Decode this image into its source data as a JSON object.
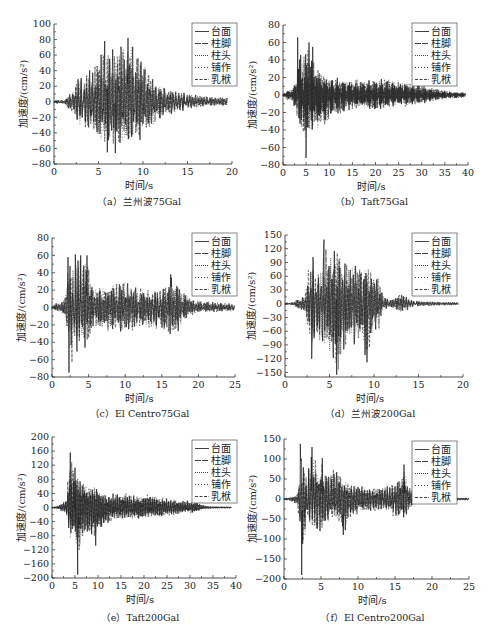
{
  "figure": {
    "panel_count": 6,
    "shared_legend": [
      "台面",
      "柱脚",
      "柱头",
      "铺作",
      "乳栿"
    ]
  },
  "chart_data": [
    {
      "id": "a",
      "type": "line",
      "title": "（a）兰州波75Gal",
      "xlabel": "时间/s",
      "ylabel": "加速度/(cm/s²)",
      "xlim": [
        0,
        20
      ],
      "ylim": [
        -80,
        100
      ],
      "xticks": [
        0,
        5,
        10,
        15,
        20
      ],
      "xtick_labels": [
        "0",
        "5",
        "10",
        "15",
        "20"
      ],
      "yticks": [
        -80,
        -60,
        -40,
        -20,
        0,
        20,
        40,
        60,
        80,
        100
      ],
      "ytick_labels": [
        "−80",
        "−60",
        "−40",
        "−20",
        "0",
        "20",
        "40",
        "60",
        "80",
        "100"
      ],
      "grid": false,
      "legend_position": "upper right",
      "duration": 19.5,
      "series": [
        {
          "name": "台面",
          "line": "solid"
        },
        {
          "name": "柱脚",
          "line": "long-dash"
        },
        {
          "name": "柱头",
          "line": "dense-dot"
        },
        {
          "name": "铺作",
          "line": "sparse-dot"
        },
        {
          "name": "乳栿",
          "line": "dash"
        }
      ],
      "envelope": [
        [
          0,
          2,
          2
        ],
        [
          1.2,
          3,
          3
        ],
        [
          1.5,
          8,
          10
        ],
        [
          2,
          12,
          15
        ],
        [
          2.7,
          35,
          30
        ],
        [
          3.5,
          40,
          40
        ],
        [
          4.5,
          50,
          45
        ],
        [
          5.5,
          70,
          60
        ],
        [
          6.5,
          75,
          62
        ],
        [
          7.5,
          78,
          60
        ],
        [
          8.5,
          80,
          60
        ],
        [
          9.5,
          70,
          55
        ],
        [
          10.5,
          45,
          40
        ],
        [
          11.5,
          25,
          28
        ],
        [
          12.5,
          20,
          20
        ],
        [
          13.5,
          16,
          16
        ],
        [
          15,
          12,
          10
        ],
        [
          17,
          8,
          6
        ],
        [
          19.5,
          6,
          5
        ]
      ],
      "peaks": [
        [
          8.3,
          82
        ],
        [
          6.0,
          -65
        ],
        [
          6.9,
          -66
        ],
        [
          5.7,
          78
        ]
      ]
    },
    {
      "id": "b",
      "type": "line",
      "title": "（b）Taft75Gal",
      "xlabel": "时间/s",
      "ylabel": "加速度/(cm/s²)",
      "xlim": [
        0,
        40
      ],
      "ylim": [
        -80,
        80
      ],
      "xticks": [
        0,
        5,
        10,
        15,
        20,
        25,
        30,
        35,
        40
      ],
      "xtick_labels": [
        "0",
        "5",
        "10",
        "15",
        "20",
        "25",
        "30",
        "35",
        "40"
      ],
      "yticks": [
        -80,
        -60,
        -40,
        -20,
        0,
        20,
        40,
        60,
        80
      ],
      "ytick_labels": [
        "−80",
        "−60",
        "−40",
        "−20",
        "0",
        "20",
        "40",
        "60",
        "80"
      ],
      "grid": false,
      "legend_position": "upper right",
      "duration": 39.5,
      "series": [
        {
          "name": "台面",
          "line": "solid"
        },
        {
          "name": "柱脚",
          "line": "long-dash"
        },
        {
          "name": "柱头",
          "line": "dense-dot"
        },
        {
          "name": "铺作",
          "line": "sparse-dot"
        },
        {
          "name": "乳栿",
          "line": "dash"
        }
      ],
      "envelope": [
        [
          0,
          2,
          2
        ],
        [
          1,
          6,
          6
        ],
        [
          2,
          8,
          6
        ],
        [
          3,
          20,
          25
        ],
        [
          3.2,
          66,
          30
        ],
        [
          4,
          45,
          45
        ],
        [
          5,
          50,
          60
        ],
        [
          6,
          55,
          50
        ],
        [
          7,
          40,
          45
        ],
        [
          9,
          25,
          38
        ],
        [
          11,
          20,
          25
        ],
        [
          15,
          18,
          18
        ],
        [
          20,
          20,
          18
        ],
        [
          25,
          18,
          15
        ],
        [
          30,
          12,
          10
        ],
        [
          33,
          8,
          8
        ],
        [
          36,
          4,
          4
        ],
        [
          39.5,
          3,
          3
        ]
      ],
      "peaks": [
        [
          3.2,
          66
        ],
        [
          5.0,
          -72
        ],
        [
          5.6,
          60
        ],
        [
          6.4,
          55
        ]
      ]
    },
    {
      "id": "c",
      "type": "line",
      "title": "（c）El Centro75Gal",
      "xlabel": "时间/s",
      "ylabel": "加速度/(cm/s²)",
      "xlim": [
        0,
        25
      ],
      "ylim": [
        -80,
        80
      ],
      "xticks": [
        0,
        5,
        10,
        15,
        20,
        25
      ],
      "xtick_labels": [
        "0",
        "5",
        "10",
        "15",
        "20",
        "25"
      ],
      "yticks": [
        -80,
        -60,
        -40,
        -20,
        0,
        20,
        40,
        60,
        80
      ],
      "ytick_labels": [
        "−80",
        "−60",
        "−40",
        "−20",
        "0",
        "20",
        "40",
        "60",
        "80"
      ],
      "grid": false,
      "legend_position": "upper right",
      "duration": 25,
      "series": [
        {
          "name": "台面",
          "line": "solid"
        },
        {
          "name": "柱脚",
          "line": "long-dash"
        },
        {
          "name": "柱头",
          "line": "dense-dot"
        },
        {
          "name": "铺作",
          "line": "sparse-dot"
        },
        {
          "name": "乳栿",
          "line": "dash"
        }
      ],
      "envelope": [
        [
          0,
          2,
          2
        ],
        [
          1,
          8,
          6
        ],
        [
          1.7,
          10,
          10
        ],
        [
          2.2,
          60,
          40
        ],
        [
          2.6,
          50,
          70
        ],
        [
          3.2,
          60,
          60
        ],
        [
          3.9,
          60,
          40
        ],
        [
          4.8,
          60,
          50
        ],
        [
          5.5,
          25,
          25
        ],
        [
          7,
          25,
          30
        ],
        [
          8.2,
          30,
          30
        ],
        [
          9.5,
          33,
          30
        ],
        [
          11,
          25,
          28
        ],
        [
          13,
          22,
          25
        ],
        [
          15.5,
          25,
          30
        ],
        [
          16.2,
          38,
          35
        ],
        [
          17.2,
          28,
          30
        ],
        [
          18.5,
          15,
          12
        ],
        [
          20,
          8,
          6
        ],
        [
          23,
          6,
          5
        ],
        [
          25,
          4,
          4
        ]
      ],
      "peaks": [
        [
          2.3,
          -75
        ],
        [
          2.2,
          58
        ],
        [
          3.2,
          61
        ],
        [
          3.9,
          60
        ],
        [
          4.8,
          60
        ],
        [
          16.2,
          38
        ]
      ]
    },
    {
      "id": "d",
      "type": "line",
      "title": "（d）兰州波200Gal",
      "xlabel": "时间/s",
      "ylabel": "加速度/(cm/s²)",
      "xlim": [
        0,
        20
      ],
      "ylim": [
        -160,
        150
      ],
      "xticks": [
        0,
        5,
        10,
        15,
        20
      ],
      "xtick_labels": [
        "0",
        "5",
        "10",
        "15",
        "20"
      ],
      "yticks": [
        -150,
        -120,
        -90,
        -60,
        -30,
        0,
        30,
        60,
        90,
        120,
        150
      ],
      "ytick_labels": [
        "−150",
        "−120",
        "−90",
        "−60",
        "−30",
        "0",
        "30",
        "60",
        "90",
        "120",
        "150"
      ],
      "grid": false,
      "legend_position": "upper right",
      "duration": 19.5,
      "series": [
        {
          "name": "台面",
          "line": "solid"
        },
        {
          "name": "柱脚",
          "line": "long-dash"
        },
        {
          "name": "柱头",
          "line": "dense-dot"
        },
        {
          "name": "铺作",
          "line": "sparse-dot"
        },
        {
          "name": "乳栿",
          "line": "dash"
        }
      ],
      "envelope": [
        [
          0,
          2,
          2
        ],
        [
          1,
          4,
          4
        ],
        [
          1.3,
          15,
          15
        ],
        [
          1.8,
          10,
          15
        ],
        [
          2.3,
          25,
          20
        ],
        [
          2.7,
          90,
          70
        ],
        [
          3.2,
          110,
          120
        ],
        [
          4,
          80,
          100
        ],
        [
          4.4,
          140,
          90
        ],
        [
          5,
          120,
          120
        ],
        [
          5.8,
          125,
          155
        ],
        [
          6.5,
          100,
          120
        ],
        [
          7.5,
          110,
          100
        ],
        [
          8.5,
          95,
          90
        ],
        [
          9.2,
          80,
          130
        ],
        [
          10,
          70,
          60
        ],
        [
          10.6,
          65,
          60
        ],
        [
          11,
          20,
          15
        ],
        [
          12,
          10,
          10
        ],
        [
          13.2,
          25,
          20
        ],
        [
          13.8,
          15,
          15
        ],
        [
          14.5,
          8,
          6
        ],
        [
          16,
          5,
          5
        ],
        [
          19.5,
          3,
          3
        ]
      ],
      "peaks": [
        [
          4.4,
          140
        ],
        [
          5.8,
          -155
        ],
        [
          9.2,
          -128
        ],
        [
          3.0,
          -120
        ]
      ]
    },
    {
      "id": "e",
      "type": "line",
      "title": "（e）Taft200Gal",
      "xlabel": "时间/s",
      "ylabel": "加速度/(cm/s²)",
      "xlim": [
        0,
        40
      ],
      "ylim": [
        -200,
        200
      ],
      "xticks": [
        0,
        5,
        10,
        15,
        20,
        25,
        30,
        35,
        40
      ],
      "xtick_labels": [
        "0",
        "5",
        "10",
        "15",
        "20",
        "25",
        "30",
        "35",
        "40"
      ],
      "yticks": [
        -200,
        -160,
        -120,
        -80,
        -40,
        0,
        40,
        80,
        120,
        160,
        200
      ],
      "ytick_labels": [
        "−200",
        "−160",
        "−120",
        "−80",
        "−40",
        "0",
        "40",
        "80",
        "120",
        "160",
        "200"
      ],
      "grid": false,
      "legend_position": "upper right",
      "duration": 39,
      "series": [
        {
          "name": "台面",
          "line": "solid"
        },
        {
          "name": "柱脚",
          "line": "long-dash"
        },
        {
          "name": "柱头",
          "line": "dense-dot"
        },
        {
          "name": "铺作",
          "line": "sparse-dot"
        },
        {
          "name": "乳栿",
          "line": "dash"
        }
      ],
      "envelope": [
        [
          0,
          2,
          2
        ],
        [
          1.5,
          5,
          5
        ],
        [
          2,
          15,
          12
        ],
        [
          3,
          20,
          15
        ],
        [
          4,
          160,
          100
        ],
        [
          4.8,
          110,
          90
        ],
        [
          5.6,
          100,
          190
        ],
        [
          6.5,
          90,
          90
        ],
        [
          8,
          70,
          80
        ],
        [
          9.5,
          60,
          110
        ],
        [
          11,
          45,
          60
        ],
        [
          13,
          40,
          40
        ],
        [
          15,
          45,
          35
        ],
        [
          18,
          35,
          35
        ],
        [
          20,
          40,
          35
        ],
        [
          23,
          35,
          30
        ],
        [
          26,
          25,
          25
        ],
        [
          29,
          20,
          15
        ],
        [
          31,
          20,
          15
        ],
        [
          33,
          6,
          5
        ],
        [
          35,
          3,
          3
        ],
        [
          39,
          2,
          2
        ]
      ],
      "peaks": [
        [
          4.0,
          156
        ],
        [
          5.6,
          -190
        ],
        [
          9.5,
          -108
        ],
        [
          5.0,
          113
        ]
      ]
    },
    {
      "id": "f",
      "type": "line",
      "title": "（f）El Centro200Gal",
      "xlabel": "时间/s",
      "ylabel": "加速度/(cm/s²)",
      "xlim": [
        0,
        25
      ],
      "ylim": [
        -200,
        150
      ],
      "xticks": [
        0,
        5,
        10,
        15,
        20,
        25
      ],
      "xtick_labels": [
        "0",
        "5",
        "10",
        "15",
        "20",
        "25"
      ],
      "yticks": [
        -200,
        -150,
        -100,
        -50,
        0,
        50,
        100,
        150
      ],
      "ytick_labels": [
        "−200",
        "−150",
        "−100",
        "−50",
        "0",
        "50",
        "100",
        "150"
      ],
      "grid": false,
      "legend_position": "upper right",
      "duration": 25,
      "series": [
        {
          "name": "台面",
          "line": "solid"
        },
        {
          "name": "柱脚",
          "line": "long-dash"
        },
        {
          "name": "柱头",
          "line": "dense-dot"
        },
        {
          "name": "铺作",
          "line": "sparse-dot"
        },
        {
          "name": "乳栿",
          "line": "dash"
        }
      ],
      "envelope": [
        [
          0,
          2,
          2
        ],
        [
          1,
          6,
          6
        ],
        [
          1.8,
          12,
          15
        ],
        [
          2.1,
          60,
          70
        ],
        [
          2.3,
          138,
          100
        ],
        [
          2.5,
          100,
          190
        ],
        [
          3.0,
          60,
          70
        ],
        [
          3.8,
          130,
          80
        ],
        [
          4.5,
          80,
          85
        ],
        [
          5.2,
          105,
          80
        ],
        [
          6,
          60,
          70
        ],
        [
          6.4,
          80,
          50
        ],
        [
          7.3,
          70,
          60
        ],
        [
          8,
          60,
          90
        ],
        [
          9,
          40,
          50
        ],
        [
          10,
          35,
          40
        ],
        [
          12,
          30,
          30
        ],
        [
          14,
          35,
          35
        ],
        [
          15,
          40,
          50
        ],
        [
          16.2,
          85,
          55
        ],
        [
          17,
          30,
          25
        ],
        [
          18,
          12,
          12
        ],
        [
          19,
          6,
          6
        ],
        [
          25,
          3,
          3
        ]
      ],
      "peaks": [
        [
          2.2,
          138
        ],
        [
          2.4,
          -190
        ],
        [
          3.8,
          130
        ],
        [
          5.2,
          102
        ],
        [
          8.0,
          -90
        ],
        [
          16.2,
          86
        ]
      ]
    }
  ]
}
